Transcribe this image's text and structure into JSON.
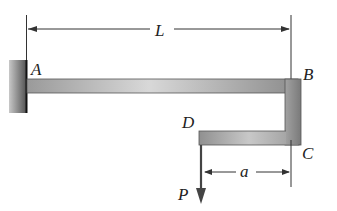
{
  "diagram": {
    "points": {
      "A": "A",
      "B": "B",
      "C": "C",
      "D": "D"
    },
    "load": {
      "label": "P",
      "direction": "down"
    },
    "dimensions": {
      "span": "L",
      "offset": "a"
    },
    "colors": {
      "member": "#8a8a8a",
      "member_highlight": "#d4d4d4",
      "wall": "#6e6e6e",
      "line": "#333333"
    }
  }
}
